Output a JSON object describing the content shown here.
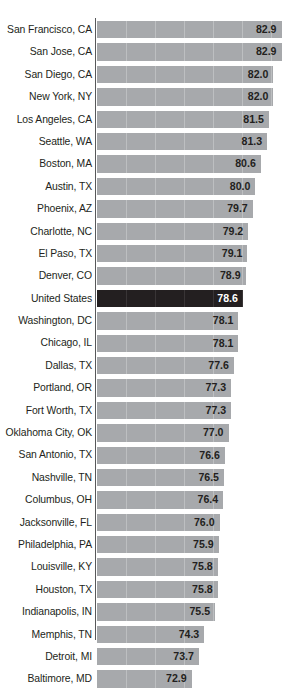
{
  "chart": {
    "type": "bar",
    "orientation": "horizontal",
    "title": "",
    "subtitle": "",
    "xlabel": "",
    "ylabel": "",
    "grid": true,
    "legend": false,
    "highlight_category": "United States",
    "colors": {
      "bar": "#a7a9ac",
      "bar_highlight": "#231f20",
      "label_text": "#231f20",
      "value_text": "#231f20",
      "value_text_highlight": "#ffffff",
      "axis": "#58595b",
      "background": "#ffffff"
    }
  },
  "chart_data": {
    "type": "bar",
    "title": "",
    "xlabel": "",
    "ylabel": "",
    "xlim": [
      62.3,
      84.6
    ],
    "grid": true,
    "legend": false,
    "orientation": "horizontal",
    "highlight": "United States",
    "categories": [
      "San Francisco, CA",
      "San Jose, CA",
      "San Diego, CA",
      "New York, NY",
      "Los Angeles, CA",
      "Seattle, WA",
      "Boston, MA",
      "Austin, TX",
      "Phoenix, AZ",
      "Charlotte, NC",
      "El Paso, TX",
      "Denver, CO",
      "United States",
      "Washington, DC",
      "Chicago, IL",
      "Dallas, TX",
      "Portland, OR",
      "Fort Worth, TX",
      "Oklahoma City, OK",
      "San Antonio, TX",
      "Nashville, TN",
      "Columbus, OH",
      "Jacksonville, FL",
      "Philadelphia, PA",
      "Louisville, KY",
      "Houston, TX",
      "Indianapolis, IN",
      "Memphis, TN",
      "Detroit, MI",
      "Baltimore, MD"
    ],
    "values": [
      82.9,
      82.9,
      82.0,
      82.0,
      81.5,
      81.3,
      80.6,
      80.0,
      79.7,
      79.2,
      79.1,
      78.9,
      78.6,
      78.1,
      78.1,
      77.6,
      77.3,
      77.3,
      77.0,
      76.6,
      76.5,
      76.4,
      76.0,
      75.9,
      75.8,
      75.8,
      75.5,
      74.3,
      73.7,
      72.9
    ],
    "value_labels": [
      "82.9",
      "82.9",
      "82.0",
      "82.0",
      "81.5",
      "81.3",
      "80.6",
      "80.0",
      "79.7",
      "79.2",
      "79.1",
      "78.9",
      "78.6",
      "78.1",
      "78.1",
      "77.6",
      "77.3",
      "77.3",
      "77.0",
      "76.6",
      "76.5",
      "76.4",
      "76.0",
      "75.9",
      "75.8",
      "75.8",
      "75.5",
      "74.3",
      "73.7",
      "72.9"
    ]
  }
}
